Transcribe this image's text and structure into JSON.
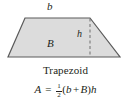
{
  "figure": {
    "name": "trapezoid-area-figure",
    "caption": "Trapezoid",
    "colors": {
      "fill": "#dcdcdc",
      "stroke": "#5a5a5a",
      "dashed": "#6e6e6e",
      "text": "#231f20",
      "background": "#ffffff"
    },
    "labels": {
      "top_base": "b",
      "bottom_base": "B",
      "height": "h"
    },
    "formula": {
      "lhs": "A",
      "equals": "=",
      "fraction_numerator": "1",
      "fraction_denominator": "2",
      "open_paren": "(",
      "term_one": "b",
      "plus": "+",
      "term_two": "B",
      "close_paren": ")",
      "multiplier": "h",
      "plain_text": "A = 1/2 (b + B)h"
    },
    "geometry": {
      "top_left_x": 25,
      "top_right_x": 90,
      "top_y": 18,
      "bottom_left_x": 8,
      "bottom_right_x": 120,
      "bottom_y": 57,
      "height_line_x": 90
    }
  }
}
